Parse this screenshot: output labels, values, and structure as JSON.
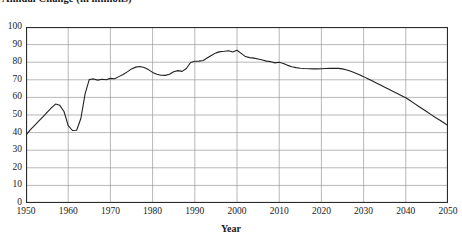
{
  "chart_data": {
    "type": "line",
    "title": "Annual Change (in millions)",
    "xlabel": "Year",
    "ylabel": "",
    "xlim": [
      1950,
      2050
    ],
    "ylim": [
      0,
      100
    ],
    "grid": true,
    "legend": "none",
    "xticks": [
      1950,
      1960,
      1970,
      1980,
      1990,
      2000,
      2010,
      2020,
      2030,
      2040,
      2050
    ],
    "yticks": [
      0,
      10,
      20,
      30,
      40,
      50,
      60,
      70,
      80,
      90,
      100
    ],
    "line_color": "#222222",
    "series": [
      {
        "name": "Annual Change",
        "x": [
          1950,
          1951,
          1952,
          1953,
          1954,
          1955,
          1956,
          1957,
          1958,
          1959,
          1960,
          1961,
          1962,
          1963,
          1964,
          1965,
          1966,
          1967,
          1968,
          1969,
          1970,
          1971,
          1972,
          1973,
          1974,
          1975,
          1976,
          1977,
          1978,
          1979,
          1980,
          1981,
          1982,
          1983,
          1984,
          1985,
          1986,
          1987,
          1988,
          1989,
          1990,
          1991,
          1992,
          1993,
          1994,
          1995,
          1996,
          1997,
          1998,
          1999,
          2000,
          2001,
          2002,
          2003,
          2004,
          2005,
          2006,
          2007,
          2008,
          2009,
          2010,
          2011,
          2012,
          2013,
          2014,
          2015,
          2016,
          2017,
          2018,
          2019,
          2020,
          2021,
          2022,
          2023,
          2024,
          2025,
          2026,
          2027,
          2028,
          2029,
          2030,
          2031,
          2032,
          2033,
          2034,
          2035,
          2036,
          2037,
          2038,
          2039,
          2040,
          2041,
          2042,
          2043,
          2044,
          2045,
          2046,
          2047,
          2048,
          2049,
          2050
        ],
        "values": [
          38.5,
          41.5,
          44.0,
          46.5,
          49.0,
          51.5,
          54.0,
          56.2,
          55.5,
          52.0,
          44.0,
          41.2,
          41.3,
          48.0,
          62.0,
          70.2,
          70.5,
          69.8,
          70.3,
          70.0,
          70.8,
          70.6,
          71.8,
          73.0,
          74.5,
          76.2,
          77.2,
          77.6,
          77.0,
          75.8,
          74.2,
          73.2,
          72.6,
          72.5,
          73.2,
          74.6,
          75.2,
          74.8,
          76.4,
          79.8,
          80.5,
          80.6,
          81.0,
          82.5,
          84.0,
          85.3,
          86.0,
          86.2,
          86.5,
          85.8,
          86.8,
          85.0,
          83.2,
          82.6,
          82.3,
          81.8,
          81.2,
          80.6,
          80.3,
          79.6,
          80.0,
          79.3,
          78.2,
          77.4,
          76.9,
          76.6,
          76.4,
          76.3,
          76.2,
          76.2,
          76.3,
          76.4,
          76.5,
          76.6,
          76.5,
          76.2,
          75.6,
          74.8,
          73.9,
          72.9,
          71.8,
          70.6,
          69.4,
          68.2,
          67.0,
          65.8,
          64.6,
          63.4,
          62.2,
          61.0,
          59.8,
          58.2,
          56.6,
          55.0,
          53.4,
          51.8,
          50.2,
          48.6,
          47.2,
          45.6,
          44.0
        ]
      }
    ]
  }
}
